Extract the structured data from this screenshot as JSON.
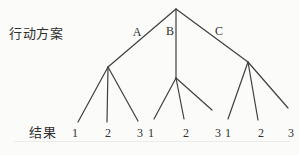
{
  "diagram": {
    "left_label": "行动方案",
    "bottom_label": "结果",
    "bg_color": "#fbfbf9",
    "line_color": "#3f3f3f",
    "text_color": "#2f2f2f",
    "branch_labels": [
      {
        "text": "A",
        "x": 137,
        "y": 32
      },
      {
        "text": "B",
        "x": 170,
        "y": 31
      },
      {
        "text": "C",
        "x": 219,
        "y": 31
      }
    ],
    "edges": [
      {
        "from": "root",
        "to": "A",
        "x1": 176,
        "y1": 9,
        "x2": 108,
        "y2": 67
      },
      {
        "from": "root",
        "to": "B",
        "x1": 176,
        "y1": 9,
        "x2": 176,
        "y2": 78
      },
      {
        "from": "root",
        "to": "C",
        "x1": 176,
        "y1": 9,
        "x2": 248,
        "y2": 62
      },
      {
        "from": "A",
        "to": "A1",
        "x1": 108,
        "y1": 67,
        "x2": 78,
        "y2": 122
      },
      {
        "from": "A",
        "to": "A2",
        "x1": 108,
        "y1": 67,
        "x2": 107,
        "y2": 122
      },
      {
        "from": "A",
        "to": "A3",
        "x1": 108,
        "y1": 67,
        "x2": 138,
        "y2": 121
      },
      {
        "from": "B",
        "to": "B1",
        "x1": 176,
        "y1": 78,
        "x2": 154,
        "y2": 119
      },
      {
        "from": "B",
        "to": "B2",
        "x1": 176,
        "y1": 78,
        "x2": 184,
        "y2": 119
      },
      {
        "from": "B",
        "to": "B3",
        "x1": 176,
        "y1": 78,
        "x2": 212,
        "y2": 110
      },
      {
        "from": "C",
        "to": "C1",
        "x1": 248,
        "y1": 62,
        "x2": 228,
        "y2": 119
      },
      {
        "from": "C",
        "to": "C2",
        "x1": 248,
        "y1": 62,
        "x2": 258,
        "y2": 120
      },
      {
        "from": "C",
        "to": "C3",
        "x1": 248,
        "y1": 62,
        "x2": 288,
        "y2": 108
      }
    ],
    "outcomes": [
      {
        "text": "1",
        "x": 75,
        "y": 133
      },
      {
        "text": "2",
        "x": 108,
        "y": 133
      },
      {
        "text": "3",
        "x": 140,
        "y": 133
      },
      {
        "text": "1",
        "x": 151,
        "y": 133
      },
      {
        "text": "2",
        "x": 186,
        "y": 133
      },
      {
        "text": "3",
        "x": 218,
        "y": 133
      },
      {
        "text": "1",
        "x": 228,
        "y": 133
      },
      {
        "text": "2",
        "x": 261,
        "y": 133
      },
      {
        "text": "3",
        "x": 291,
        "y": 133
      }
    ]
  }
}
